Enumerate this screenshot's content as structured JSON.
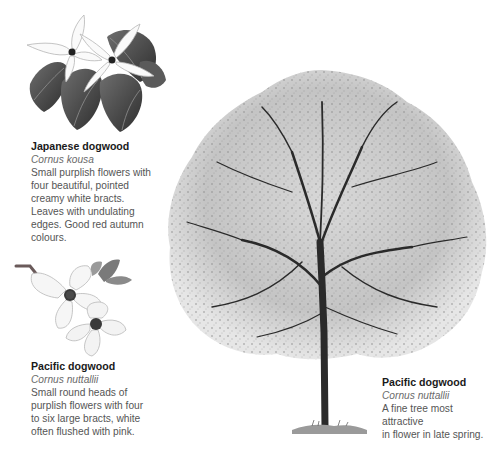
{
  "page": {
    "background": "#ffffff"
  },
  "species": [
    {
      "id": "japanese-dogwood",
      "common_name": "Japanese dogwood",
      "latin_name": "Cornus kousa",
      "description_lines": [
        "Small purplish flowers with",
        "four beautiful, pointed",
        "creamy white bracts.",
        "Leaves with undulating",
        "edges. Good red autumn",
        "colours."
      ],
      "illustration": "flower-and-leaves-illustration"
    },
    {
      "id": "pacific-dogwood-flower",
      "common_name": "Pacific dogwood",
      "latin_name": "Cornus nuttallii",
      "description_lines": [
        "Small round heads of",
        "purplish flowers with four",
        "to six large bracts, white",
        "often flushed with pink."
      ],
      "illustration": "flower-sprig-illustration"
    },
    {
      "id": "pacific-dogwood-tree",
      "common_name": "Pacific dogwood",
      "latin_name": "Cornus nuttallii",
      "description_lines": [
        "A fine tree most attractive",
        "in flower in late spring."
      ],
      "illustration": "tree-illustration"
    }
  ],
  "colors": {
    "title_text": "#1a1a1a",
    "body_text": "#555555",
    "latin_text": "#6a6a6a",
    "leaf_dark": "#3a3a3a",
    "trunk": "#2a2a2a"
  }
}
